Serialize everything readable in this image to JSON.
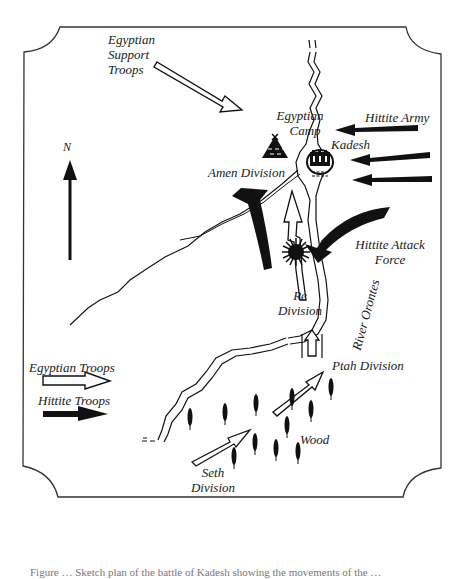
{
  "map": {
    "title": "Battle of Kadesh",
    "compass": {
      "label": "N"
    },
    "labels": {
      "egyptian_support_troops": [
        "Egyptian",
        "Support",
        "Troops"
      ],
      "egyptian_camp": [
        "Egyptian",
        "Camp"
      ],
      "kadesh": "Kadesh",
      "hittite_army": "Hittite Army",
      "amen_division": "Amen Division",
      "hittite_attack_force": [
        "Hittite Attack",
        "Force"
      ],
      "re_division": [
        "Re",
        "Division"
      ],
      "river_orontes": "River Orontes",
      "ptah_division": "Ptah Division",
      "wood": "Wood",
      "seth_division": [
        "Seth",
        "Division"
      ]
    },
    "legend": {
      "items": [
        {
          "label": "Egyptian Troops",
          "style": "outline-arrow",
          "color": "#ffffff"
        },
        {
          "label": "Hittite Troops",
          "style": "solid-arrow",
          "color": "#111111"
        }
      ]
    },
    "colors": {
      "ink": "#111111",
      "paper": "#ffffff",
      "border": "#333333"
    }
  },
  "caption": "Figure … Sketch plan of the battle of Kadesh showing the movements of the …"
}
